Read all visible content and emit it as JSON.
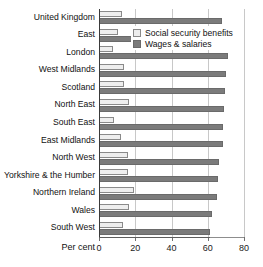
{
  "chart_data": {
    "type": "bar",
    "orientation": "horizontal",
    "title": "",
    "subtitle": "",
    "xlabel": "Per cent",
    "ylabel": "",
    "xlim": [
      0,
      80
    ],
    "xticks": [
      0,
      20,
      40,
      60,
      80
    ],
    "xtick_labels": [
      "0",
      "20",
      "40",
      "60",
      "80"
    ],
    "grid": "vertical",
    "legend_position": "top-right-inside",
    "categories": [
      "United Kingdom",
      "East",
      "London",
      "West Midlands",
      "Scotland",
      "North East",
      "South East",
      "East Midlands",
      "North West",
      "Yorkshire & the Humber",
      "Northern Ireland",
      "Wales",
      "South West"
    ],
    "series": [
      {
        "name": "Social security benefits",
        "color": "#eeeeee",
        "values": [
          12.7,
          10.5,
          7.7,
          13.8,
          13.9,
          16.6,
          8.3,
          12.2,
          15.8,
          15.8,
          19.1,
          16.6,
          13.5
        ]
      },
      {
        "name": "Wages & salaries",
        "color": "#7b7b7b",
        "values": [
          67.9,
          71.2,
          71.0,
          70.2,
          69.3,
          68.9,
          68.6,
          68.2,
          66.4,
          65.6,
          64.9,
          62.3,
          61.2
        ]
      }
    ],
    "legend": [
      "Social security benefits",
      "Wages & salaries"
    ]
  }
}
